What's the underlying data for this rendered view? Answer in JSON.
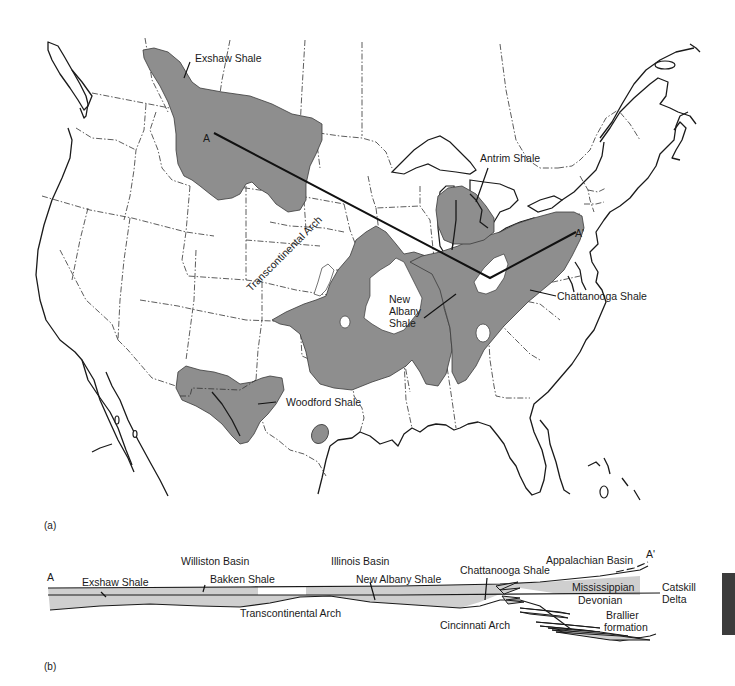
{
  "figure": {
    "panel_a_label": "(a)",
    "panel_b_label": "(b)"
  },
  "map": {
    "section_endpoints": {
      "start": "A",
      "end": "A'"
    },
    "shale_labels": {
      "exshaw": "Exshaw Shale",
      "antrim": "Antrim Shale",
      "chattanooga": "Chattanooga Shale",
      "new_albany_line1": "New",
      "new_albany_line2": "Albany",
      "new_albany_line3": "Shale",
      "woodford": "Woodford Shale"
    },
    "structure_labels": {
      "transcontinental_arch": "Transcontinental Arch"
    },
    "shale_fill_color": "#8e8e8e"
  },
  "cross_section": {
    "endpoint_start": "A",
    "endpoint_end": "A'",
    "labels": {
      "williston_basin": "Williston Basin",
      "illinois_basin": "Illinois Basin",
      "appalachian_basin": "Appalachian Basin",
      "exshaw_shale": "Exshaw Shale",
      "bakken_shale": "Bakken Shale",
      "new_albany_shale": "New Albany Shale",
      "chattanooga_shale": "Chattanooga Shale",
      "mississippian": "Mississippian",
      "devonian": "Devonian",
      "catskill_line1": "Catskill",
      "catskill_line2": "Delta",
      "brallier_line1": "Brallier",
      "brallier_line2": "formation",
      "transcontinental_arch": "Transcontinental Arch",
      "cincinnati_arch": "Cincinnati Arch"
    },
    "shale_fill_color": "#cfcfcf"
  }
}
